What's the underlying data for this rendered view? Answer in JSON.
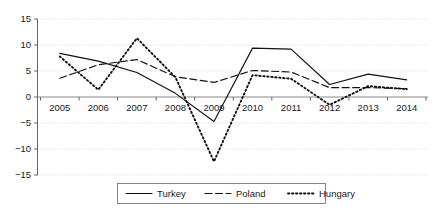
{
  "chart_data": {
    "type": "line",
    "title": "",
    "xlabel": "",
    "ylabel": "",
    "categories": [
      2005,
      2006,
      2007,
      2008,
      2009,
      2010,
      2011,
      2012,
      2013,
      2014
    ],
    "xticklabels": [
      "2005",
      "2006",
      "2007",
      "2008",
      "2009",
      "2010",
      "2011",
      "2012",
      "2013",
      "2014"
    ],
    "yticklabels": [
      "15",
      "10",
      "5",
      "0",
      "−5",
      "−10",
      "−15"
    ],
    "ytickvalues": [
      15,
      10,
      5,
      0,
      -5,
      -10,
      -15
    ],
    "ylim": [
      -15,
      15
    ],
    "xlim": [
      2005,
      2014
    ],
    "grid": true,
    "legend_position": "bottom-center",
    "series": [
      {
        "name": "Turkey",
        "style": "solid",
        "values": [
          8.4,
          6.9,
          4.7,
          0.7,
          -4.7,
          9.4,
          9.2,
          2.4,
          4.4,
          3.3
        ]
      },
      {
        "name": "Poland",
        "style": "dashed",
        "values": [
          3.6,
          6.2,
          7.2,
          3.9,
          2.8,
          5.1,
          4.8,
          1.8,
          1.8,
          1.6
        ]
      },
      {
        "name": "Hungary",
        "style": "dotted",
        "values": [
          7.8,
          1.4,
          11.3,
          3.8,
          -12.4,
          4.2,
          3.5,
          -1.5,
          2.1,
          1.5
        ]
      }
    ]
  },
  "legend": {
    "entries": [
      {
        "label": "Turkey",
        "style": "solid"
      },
      {
        "label": "Poland",
        "style": "dashed"
      },
      {
        "label": "Hungary",
        "style": "dotted"
      }
    ]
  }
}
